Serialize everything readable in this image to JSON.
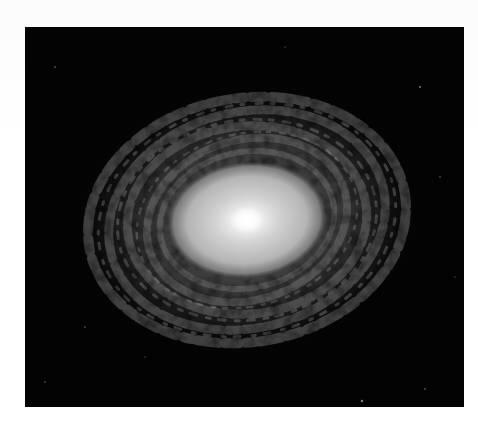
{
  "image": {
    "subject": "spiral galaxy",
    "palette": {
      "surround": "#ffffff",
      "frame_background": "#030303",
      "core": "#ffffff",
      "bulge": "#c8c8c8",
      "arms": "#5a5a5a"
    },
    "frame": {
      "x": 25,
      "y": 27,
      "width": 439,
      "height": 380
    },
    "core_center": {
      "x": 247,
      "y": 220
    }
  }
}
